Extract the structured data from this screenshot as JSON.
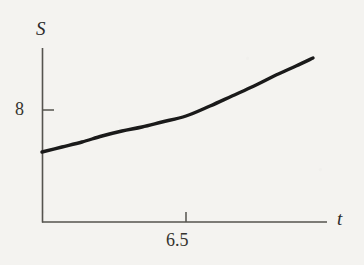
{
  "figure": {
    "background_color": "#f4f3f0",
    "ink_color": "#1a1a1a",
    "axis_color": "#55534e",
    "axis_label_y": "S",
    "axis_label_x": "t",
    "ytick_label": "8",
    "xtick_label": "6.5"
  },
  "chart_data": {
    "type": "line",
    "title": "",
    "subtitle": "",
    "xlabel": "t",
    "ylabel": "S",
    "grid": false,
    "legend": null,
    "xticks": [
      6.5
    ],
    "xticklabels": [
      "6.5"
    ],
    "yticks": [
      8
    ],
    "yticklabels": [
      "8"
    ],
    "xlim": [
      6.0,
      7.05
    ],
    "ylim": [
      7.0,
      9.4
    ],
    "annotations": [],
    "series": [
      {
        "name": "S(t)",
        "comment": "smooth increasing convex curve, drawn as thick black ink stroke",
        "x": [
          6.0,
          6.1,
          6.2,
          6.3,
          6.4,
          6.5,
          6.6,
          6.7,
          6.8,
          6.9,
          6.95
        ],
        "y": [
          7.7,
          7.78,
          7.86,
          7.95,
          8.04,
          8.14,
          8.3,
          8.5,
          8.74,
          9.0,
          9.15
        ]
      }
    ],
    "pixel_geometry": {
      "origin": [
        42,
        222
      ],
      "y_axis_top": 48,
      "x_axis_right": 327,
      "y_tick_y": 110,
      "x_tick_x": 186,
      "curve_points": [
        [
          42,
          152
        ],
        [
          62,
          147
        ],
        [
          82,
          142
        ],
        [
          102,
          136
        ],
        [
          122,
          131
        ],
        [
          142,
          127
        ],
        [
          162,
          122
        ],
        [
          186,
          116
        ],
        [
          210,
          106
        ],
        [
          232,
          96
        ],
        [
          254,
          86
        ],
        [
          276,
          75
        ],
        [
          296,
          66
        ],
        [
          313,
          58
        ]
      ]
    }
  }
}
